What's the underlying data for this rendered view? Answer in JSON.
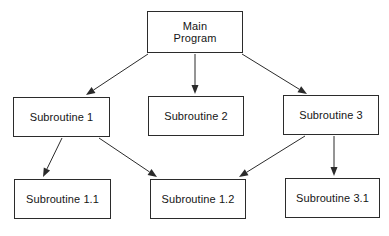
{
  "diagram": {
    "type": "hierarchy-structure-chart",
    "background_color": "#ffffff",
    "node_fill_color": "#ffffff",
    "node_border_color": "#2b2b2b",
    "text_color": "#151515",
    "edge_color": "#2b2b2b",
    "nodes": [
      {
        "id": "main-program",
        "label": "Main\nProgram",
        "level": 0,
        "x": 147,
        "y": 11,
        "width": 96,
        "height": 42
      },
      {
        "id": "subroutine-1",
        "label": "Subroutine 1",
        "level": 1,
        "x": 13,
        "y": 97,
        "width": 97,
        "height": 40
      },
      {
        "id": "subroutine-2",
        "label": "Subroutine 2",
        "level": 1,
        "x": 148,
        "y": 96,
        "width": 96,
        "height": 40
      },
      {
        "id": "subroutine-3",
        "label": "Subroutine 3",
        "level": 1,
        "x": 283,
        "y": 95,
        "width": 96,
        "height": 40
      },
      {
        "id": "subroutine-1-1",
        "label": "Subroutine 1.1",
        "level": 2,
        "x": 14,
        "y": 179,
        "width": 97,
        "height": 40
      },
      {
        "id": "subroutine-1-2",
        "label": "Subroutine 1.2",
        "level": 2,
        "x": 150,
        "y": 179,
        "width": 96,
        "height": 40
      },
      {
        "id": "subroutine-3-1",
        "label": "Subroutine 3.1",
        "level": 2,
        "x": 285,
        "y": 178,
        "width": 95,
        "height": 40
      }
    ],
    "edges": [
      {
        "id": "edge-main-to-sub1",
        "from": "main-program",
        "to": "subroutine-1",
        "x1": 148,
        "y1": 54,
        "x2": 86,
        "y2": 95,
        "arrowhead": "filled-triangle"
      },
      {
        "id": "edge-main-to-sub2",
        "from": "main-program",
        "to": "subroutine-2",
        "x1": 195,
        "y1": 54,
        "x2": 195,
        "y2": 94,
        "arrowhead": "filled-triangle"
      },
      {
        "id": "edge-main-to-sub3",
        "from": "main-program",
        "to": "subroutine-3",
        "x1": 242,
        "y1": 54,
        "x2": 307,
        "y2": 94,
        "arrowhead": "filled-triangle"
      },
      {
        "id": "edge-sub1-to-sub11",
        "from": "subroutine-1",
        "to": "subroutine-1-1",
        "x1": 62,
        "y1": 138,
        "x2": 43,
        "y2": 177,
        "arrowhead": "filled-triangle"
      },
      {
        "id": "edge-sub1-to-sub12",
        "from": "subroutine-1",
        "to": "subroutine-1-2",
        "x1": 99,
        "y1": 138,
        "x2": 157,
        "y2": 177,
        "arrowhead": "filled-triangle"
      },
      {
        "id": "edge-sub3-to-sub12",
        "from": "subroutine-3",
        "to": "subroutine-1-2",
        "x1": 305,
        "y1": 136,
        "x2": 239,
        "y2": 177,
        "arrowhead": "filled-triangle"
      },
      {
        "id": "edge-sub3-to-sub31",
        "from": "subroutine-3",
        "to": "subroutine-3-1",
        "x1": 334,
        "y1": 136,
        "x2": 334,
        "y2": 176,
        "arrowhead": "filled-triangle"
      }
    ]
  }
}
